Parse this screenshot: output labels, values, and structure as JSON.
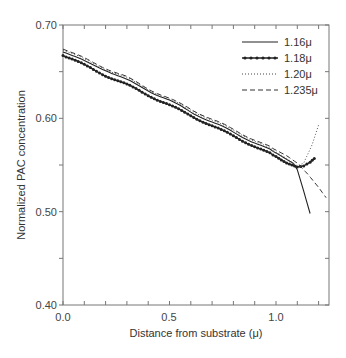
{
  "chart_data": {
    "type": "line",
    "title": "",
    "xlabel": "Distance from substrate (μ)",
    "ylabel": "Normalized PAC concentration",
    "xlim": [
      0.0,
      1.25
    ],
    "ylim": [
      0.4,
      0.7
    ],
    "x_ticks": [
      "0.0",
      "0.5",
      "1.0"
    ],
    "y_ticks": [
      "0.40",
      "0.50",
      "0.60",
      "0.70"
    ],
    "grid": false,
    "legend_position": "upper right",
    "series": [
      {
        "name": "1.16μ",
        "style": "solid",
        "x": [
          0.0,
          0.1,
          0.2,
          0.3,
          0.4,
          0.5,
          0.6,
          0.7,
          0.8,
          0.9,
          1.0,
          1.05,
          1.08,
          1.1,
          1.13,
          1.16
        ],
        "y": [
          0.672,
          0.661,
          0.652,
          0.641,
          0.63,
          0.619,
          0.607,
          0.596,
          0.585,
          0.574,
          0.563,
          0.556,
          0.552,
          0.545,
          0.522,
          0.498
        ]
      },
      {
        "name": "1.18μ",
        "style": "solid-dots",
        "x": [
          0.0,
          0.1,
          0.2,
          0.3,
          0.4,
          0.5,
          0.6,
          0.7,
          0.8,
          0.9,
          1.0,
          1.05,
          1.1,
          1.13,
          1.16,
          1.18
        ],
        "y": [
          0.668,
          0.657,
          0.646,
          0.636,
          0.625,
          0.614,
          0.603,
          0.592,
          0.581,
          0.57,
          0.559,
          0.552,
          0.548,
          0.549,
          0.553,
          0.557
        ]
      },
      {
        "name": "1.20μ",
        "style": "dotted",
        "x": [
          0.0,
          0.1,
          0.2,
          0.3,
          0.4,
          0.5,
          0.6,
          0.7,
          0.8,
          0.9,
          1.0,
          1.05,
          1.1,
          1.13,
          1.17,
          1.2
        ],
        "y": [
          0.674,
          0.663,
          0.653,
          0.643,
          0.631,
          0.62,
          0.609,
          0.598,
          0.587,
          0.576,
          0.564,
          0.557,
          0.549,
          0.552,
          0.572,
          0.593
        ]
      },
      {
        "name": "1.235μ",
        "style": "dashed",
        "x": [
          0.0,
          0.1,
          0.2,
          0.3,
          0.4,
          0.5,
          0.6,
          0.7,
          0.8,
          0.9,
          1.0,
          1.05,
          1.1,
          1.15,
          1.2,
          1.235
        ],
        "y": [
          0.675,
          0.664,
          0.654,
          0.644,
          0.632,
          0.621,
          0.61,
          0.599,
          0.588,
          0.577,
          0.566,
          0.56,
          0.552,
          0.54,
          0.526,
          0.515
        ]
      }
    ]
  },
  "legend": {
    "items": [
      {
        "label": "1.16μ"
      },
      {
        "label": "1.18μ"
      },
      {
        "label": "1.20μ"
      },
      {
        "label": "1.235μ"
      }
    ]
  },
  "axes": {
    "xlabel": "Distance from substrate (μ)",
    "ylabel": "Normalized PAC concentration",
    "x_ticks": [
      "0.0",
      "0.5",
      "1.0"
    ],
    "y_ticks": [
      "0.70",
      "0.60",
      "0.50",
      "0.40"
    ]
  }
}
